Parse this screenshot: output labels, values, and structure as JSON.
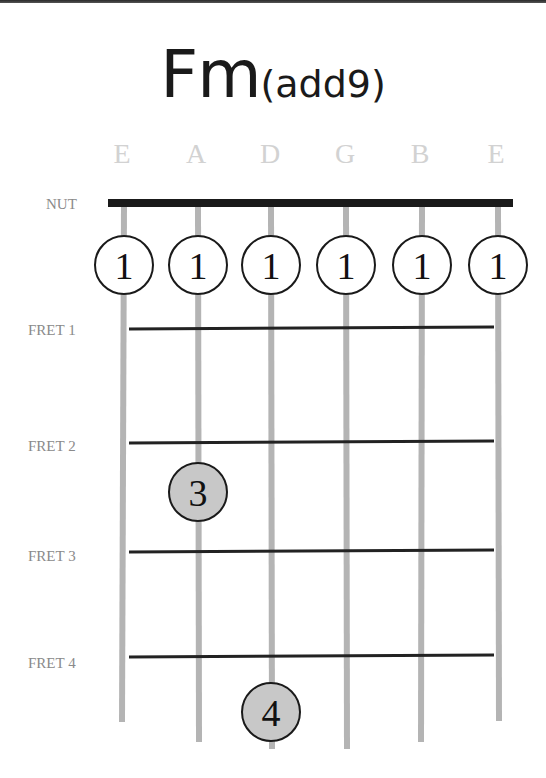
{
  "chord": {
    "root": "Fm",
    "extension": "(add9)"
  },
  "strings": [
    "E",
    "A",
    "D",
    "G",
    "B",
    "E"
  ],
  "labels": {
    "nut": "NUT",
    "frets": [
      "FRET 1",
      "FRET 2",
      "FRET 3",
      "FRET 4"
    ]
  },
  "fingerings": {
    "open_row": [
      "1",
      "1",
      "1",
      "1",
      "1",
      "1"
    ],
    "fretted": [
      {
        "string": "A",
        "fret": 2,
        "finger": "3"
      },
      {
        "string": "D",
        "fret": 4,
        "finger": "4"
      }
    ]
  },
  "colors": {
    "nut": "#1a1a1a",
    "string": "#b4b4b4",
    "fret": "#222222",
    "finger_open_fill": "#ffffff",
    "finger_fretted_fill": "#c8c8c8",
    "string_name": "#d2d2d2",
    "fret_label": "#8a8a8a"
  }
}
